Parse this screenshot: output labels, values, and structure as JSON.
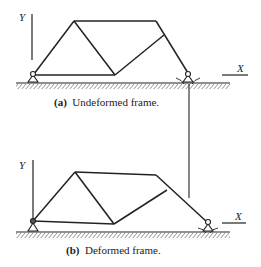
{
  "diagram": {
    "panel_a": {
      "label_prefix": "(a)",
      "caption": "Undeformed frame.",
      "axis_y": "Y",
      "axis_x": "X"
    },
    "panel_b": {
      "label_prefix": "(b)",
      "caption": "Deformed frame.",
      "axis_y": "Y",
      "axis_x": "X"
    },
    "colors": {
      "line": "#222222",
      "background": "#ffffff"
    }
  }
}
